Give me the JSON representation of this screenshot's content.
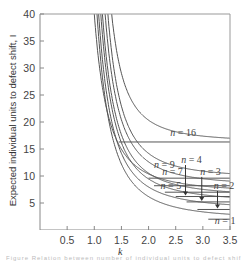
{
  "chart_data": {
    "type": "line",
    "title": "",
    "xlabel": "k",
    "ylabel": "Expected individual units to defect shift, I",
    "xlim": [
      0,
      3.5
    ],
    "ylim": [
      0,
      40
    ],
    "x_ticks": [
      0.5,
      1.0,
      1.5,
      2.0,
      2.5,
      3.0,
      3.5
    ],
    "x_tick_labels": [
      "0.5",
      "1.0",
      "1.5",
      "2.0",
      "2.5",
      "3.0",
      "3.5"
    ],
    "y_ticks": [
      5,
      10,
      15,
      20,
      25,
      30,
      35,
      40
    ],
    "y_tick_labels": [
      "5",
      "10",
      "15",
      "20",
      "25",
      "30",
      "35",
      "40"
    ],
    "grid": false,
    "legend": "inline labels",
    "series": [
      {
        "name": "n = 1",
        "asymptote": 2.0,
        "label": "n = 1",
        "label_pos": [
          3.22,
          1.2
        ],
        "arrow": false
      },
      {
        "name": "n = 2",
        "asymptote": 3.8,
        "label": "n = 2",
        "label_pos": [
          3.2,
          7.6
        ],
        "arrow": true,
        "arrow_x": 3.27
      },
      {
        "name": "n = 3",
        "asymptote": 5.2,
        "label": "n = 3",
        "label_pos": [
          2.95,
          10.2
        ],
        "arrow": true,
        "arrow_x": 2.98
      },
      {
        "name": "n = 4",
        "asymptote": 6.2,
        "label": "n = 4",
        "label_pos": [
          2.6,
          12.4
        ],
        "arrow": true,
        "arrow_x": 2.68
      },
      {
        "name": "n = 5",
        "asymptote": 7.0,
        "label": "n = 5",
        "label_pos": [
          2.22,
          7.6
        ],
        "arrow": false
      },
      {
        "name": "n = 7",
        "asymptote": 8.2,
        "label": "n = 7",
        "label_pos": [
          2.25,
          10.2
        ],
        "arrow": false
      },
      {
        "name": "n = 9",
        "asymptote": 9.6,
        "label": "n = 9",
        "label_pos": [
          2.1,
          11.4
        ],
        "arrow": false
      },
      {
        "name": "n = 16",
        "asymptote": 16.3,
        "label": "n = 16",
        "label_pos": [
          2.4,
          17.4
        ],
        "arrow": false
      }
    ],
    "curves_note": "Family of hyperbolic decay curves descending from I=40 near k≈1.0–1.3, flattening into horizontal asymptotes per n"
  },
  "caption": {
    "text": "Figure  Relation between number of individual units to defect shift for"
  }
}
